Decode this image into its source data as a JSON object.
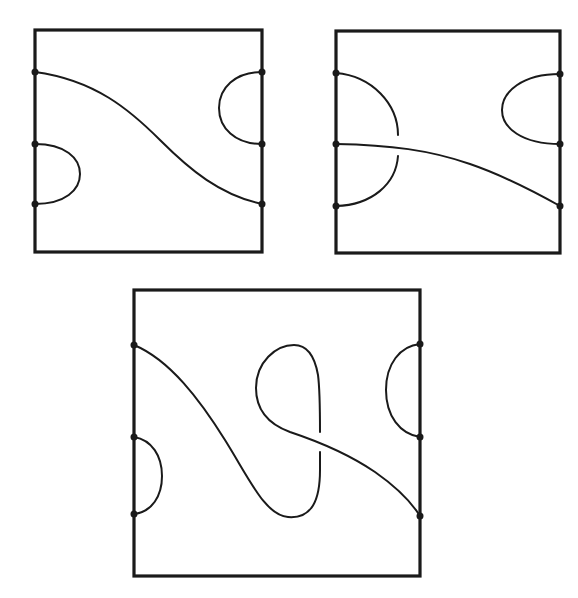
{
  "figure": {
    "colors": {
      "background": "#ffffff",
      "ink": "#1a1a1a"
    },
    "panels": [
      {
        "id": "top-left",
        "box": {
          "x": 35,
          "y": 30,
          "w": 227,
          "h": 222
        },
        "endpoints_left_y": [
          72,
          144,
          204
        ],
        "endpoints_right_y": [
          72,
          144,
          204
        ],
        "crossings": 0
      },
      {
        "id": "top-right",
        "box": {
          "x": 336,
          "y": 31,
          "w": 224,
          "h": 222
        },
        "endpoints_left_y": [
          73,
          144,
          206
        ],
        "endpoints_right_y": [
          74,
          144,
          206
        ],
        "crossings": 1
      },
      {
        "id": "bottom",
        "box": {
          "x": 134,
          "y": 290,
          "w": 286,
          "h": 286
        },
        "endpoints_left_y": [
          345,
          437,
          514
        ],
        "endpoints_right_y": [
          344,
          437,
          516
        ],
        "crossings": 1
      }
    ]
  }
}
